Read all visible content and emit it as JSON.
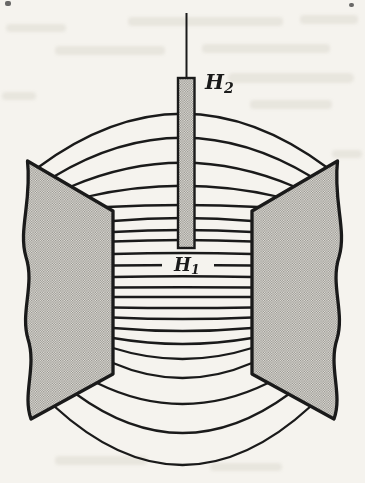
{
  "figure": {
    "labels": {
      "h2": {
        "base": "H",
        "sub": "2"
      },
      "h1": {
        "base": "H",
        "sub": "1"
      }
    },
    "colors": {
      "paper": "#f5f3ee",
      "ink": "#1a1a1a",
      "stipple_bg": "#e8e6e1",
      "stipple_dot": "#8e8c86"
    }
  }
}
